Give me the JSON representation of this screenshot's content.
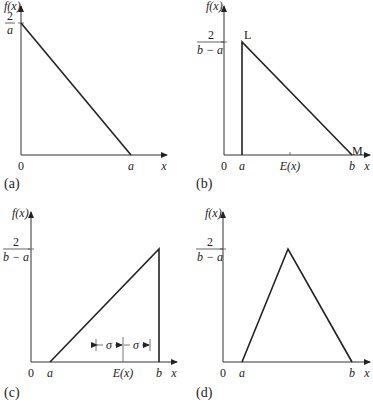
{
  "panels": [
    {
      "id": "a",
      "label": "(a)",
      "y_axis_label": "f(x)",
      "x_axis_label": "x",
      "y_tick": {
        "num": "2",
        "den": "a"
      },
      "x_ticks": [
        "0",
        "a"
      ],
      "shape": "right-triangle decreasing from (0, 2/a) to (a, 0)"
    },
    {
      "id": "b",
      "label": "(b)",
      "y_axis_label": "f(x)",
      "x_axis_label": "x",
      "y_tick": {
        "num": "2",
        "den": "b − a"
      },
      "x_ticks": [
        "0",
        "a",
        "E(x)",
        "b"
      ],
      "point_labels": [
        "L",
        "M"
      ],
      "shape": "vertical edge at a, decreasing to b"
    },
    {
      "id": "c",
      "label": "(c)",
      "y_axis_label": "f(x)",
      "x_axis_label": "x",
      "y_tick": {
        "num": "2",
        "den": "b − a"
      },
      "x_ticks": [
        "0",
        "a",
        "E(x)",
        "b"
      ],
      "sigma_label": "σ",
      "shape": "increasing from a to b, vertical edge at b"
    },
    {
      "id": "d",
      "label": "(d)",
      "y_axis_label": "f(x)",
      "x_axis_label": "x",
      "y_tick": {
        "num": "2",
        "den": "b − a"
      },
      "x_ticks": [
        "0",
        "a",
        "b"
      ],
      "shape": "symmetric triangle from a to b with peak at midpoint"
    }
  ]
}
